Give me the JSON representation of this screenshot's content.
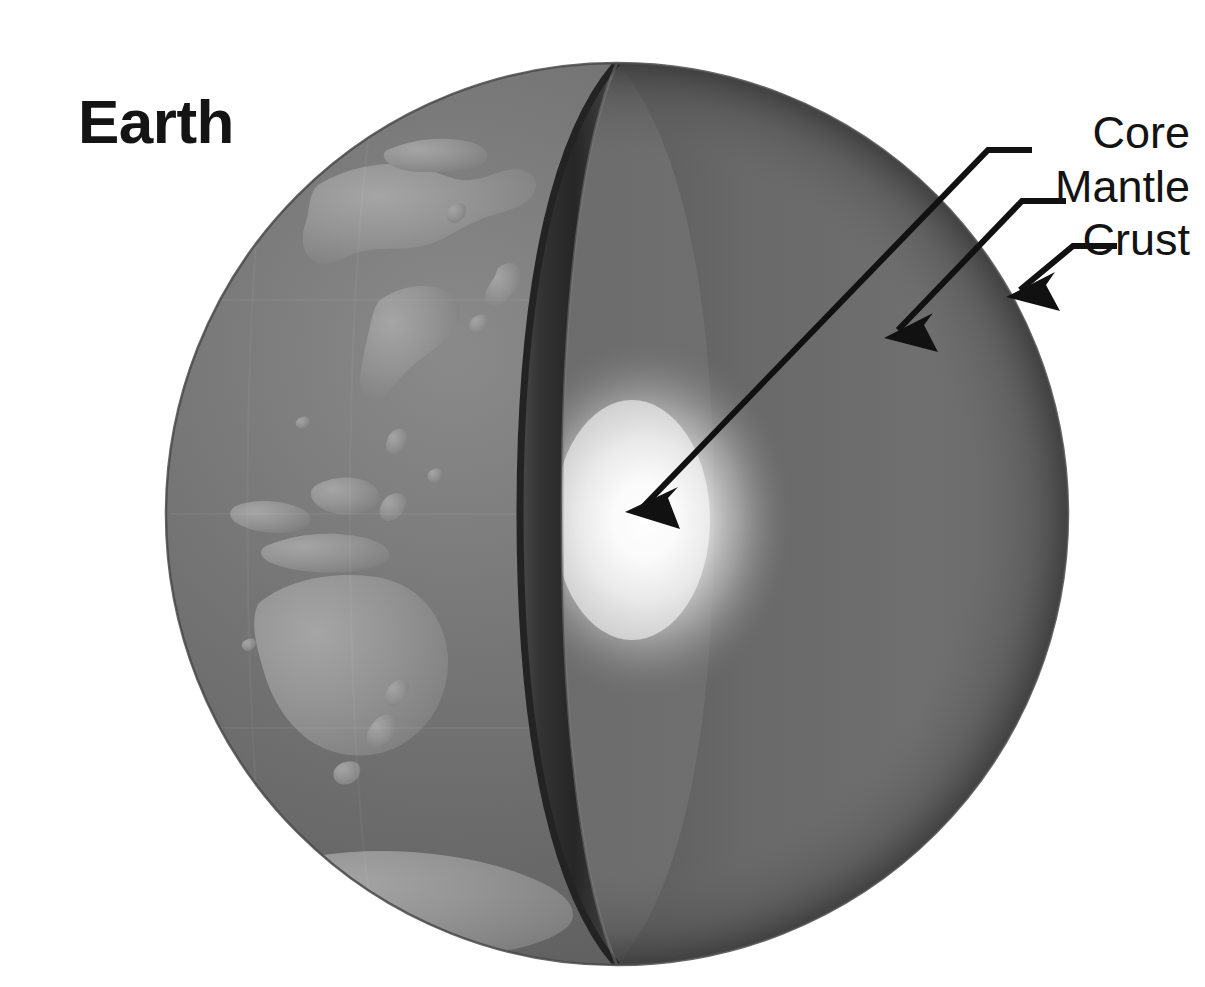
{
  "canvas": {
    "width": 1205,
    "height": 987,
    "background": "#ffffff"
  },
  "title": {
    "text": "Earth",
    "x": 78,
    "y": 143
  },
  "globe": {
    "center_x": 617,
    "center_y": 514,
    "radius": 451,
    "surface_ocean_color": "#6b6b6b",
    "surface_land_color": "#8f8f8f",
    "cut_rim_color": "#2e2e2e",
    "mantle_color": "#6e6e6e",
    "core_color": "#f2f2f2",
    "outline_color": "#3a3a3a"
  },
  "labels": [
    {
      "id": "core",
      "text": "Core",
      "text_x": 1190,
      "text_y": 148,
      "elbow_x": 988,
      "elbow_y": 150,
      "horizontal_end_x": 1032,
      "tip_x": 625,
      "tip_y": 512,
      "color": "#111111"
    },
    {
      "id": "mantle",
      "text": "Mantle",
      "text_x": 1190,
      "text_y": 202,
      "elbow_x": 1022,
      "elbow_y": 201,
      "horizontal_end_x": 1066,
      "tip_x": 884,
      "tip_y": 338,
      "color": "#111111"
    },
    {
      "id": "crust",
      "text": "Crust",
      "text_x": 1190,
      "text_y": 255,
      "elbow_x": 1073,
      "elbow_y": 246,
      "horizontal_end_x": 1117,
      "tip_x": 1006,
      "tip_y": 297,
      "color": "#111111"
    }
  ],
  "layers": [
    {
      "name": "Core",
      "description": "innermost bright glowing sphere"
    },
    {
      "name": "Mantle",
      "description": "thick mid gray cut-away interior"
    },
    {
      "name": "Crust",
      "description": "thin outer shell at the sphere edge"
    }
  ]
}
